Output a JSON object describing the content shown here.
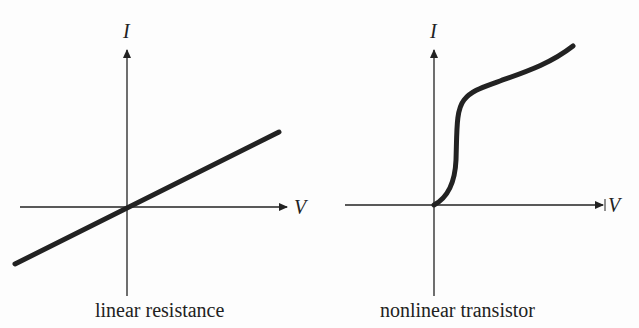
{
  "diagrams": [
    {
      "caption": "linear resistance",
      "x_axis_label": "V",
      "y_axis_label": "I",
      "curve_type": "linear"
    },
    {
      "caption": "nonlinear transistor",
      "x_axis_label": "V",
      "y_axis_label": "I",
      "curve_type": "nonlinear"
    }
  ],
  "colors": {
    "ink": "#222222",
    "background": "#fdfdfd"
  }
}
